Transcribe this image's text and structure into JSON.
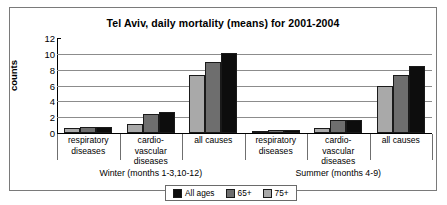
{
  "chart_data": {
    "type": "bar",
    "title": "Tel Aviv, daily mortality  (means) for  2001-2004",
    "xlabel": "",
    "ylabel": "counts",
    "ylim": [
      0,
      12
    ],
    "yticks": [
      12,
      10,
      8,
      6,
      4,
      2,
      0
    ],
    "grid": true,
    "legend_position": "bottom-center",
    "categories": [
      "respiratory diseases",
      "cardio-vascular diseases",
      "all causes",
      "respiratory diseases",
      "cardio-vascular diseases",
      "all causes"
    ],
    "category_lines": [
      [
        "respiratory",
        "diseases"
      ],
      [
        "cardio-",
        "vascular",
        "diseases"
      ],
      [
        "all causes"
      ],
      [
        "respiratory",
        "diseases"
      ],
      [
        "cardio-",
        "vascular",
        "diseases"
      ],
      [
        "all causes"
      ]
    ],
    "groups": [
      {
        "label": "Winter (months 1-3,10-12)",
        "categories": [
          0,
          1,
          2
        ]
      },
      {
        "label": "Summer (months 4-9)",
        "categories": [
          3,
          4,
          5
        ]
      }
    ],
    "series": [
      {
        "name": "All ages",
        "color": "#a9a9a9",
        "legend_color": "#0d0d0d",
        "values": [
          0.6,
          1.1,
          7.3,
          0.25,
          0.6,
          5.9
        ]
      },
      {
        "name": "65+",
        "color": "#6e6e6e",
        "legend_color": "#6e6e6e",
        "values": [
          0.75,
          2.4,
          9.0,
          0.35,
          1.6,
          7.3
        ]
      },
      {
        "name": "75+",
        "color": "#0d0d0d",
        "legend_color": "#a9a9a9",
        "values": [
          0.75,
          2.6,
          10.1,
          0.35,
          1.7,
          8.5
        ]
      }
    ]
  }
}
